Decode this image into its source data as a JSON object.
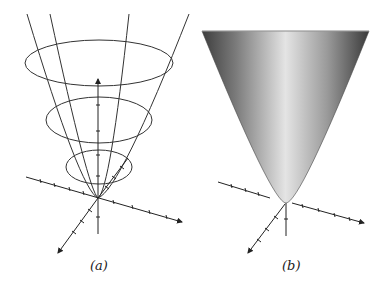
{
  "figure": {
    "panels": [
      {
        "id": "a",
        "label": "(a)",
        "description": "Wireframe paraboloid: level-curve ellipses and parabolic traces with 3D coordinate axes"
      },
      {
        "id": "b",
        "label": "(b)",
        "description": "Shaded paraboloid surface with 3D coordinate axes"
      }
    ],
    "colors": {
      "line": "#333333",
      "surface_dark": "#4a4a4a",
      "surface_light": "#e6e6e6",
      "background": "#ffffff"
    }
  }
}
